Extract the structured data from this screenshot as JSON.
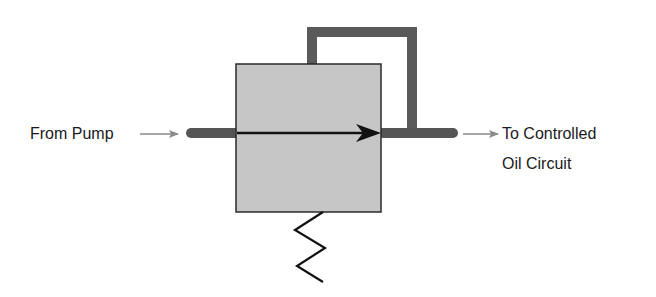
{
  "diagram": {
    "type": "hydraulic-valve-schematic",
    "labels": {
      "inlet": "From Pump",
      "outlet_line1": "To Controlled",
      "outlet_line2": "Oil Circuit"
    },
    "components": {
      "valve_body": "valve-box",
      "flow_arrow": "flow-direction-arrow",
      "feedback_line": "pilot-feedback-line",
      "spring": "control-spring",
      "inlet_pipe": "inlet-pipe",
      "outlet_pipe": "outlet-pipe"
    },
    "colors": {
      "box_fill": "#c6c6c6",
      "box_border": "#2a2a2a",
      "pipe": "#555555",
      "arrow": "#111111",
      "label_arrow": "#8a8a8a",
      "text": "#1a1a1a"
    }
  }
}
